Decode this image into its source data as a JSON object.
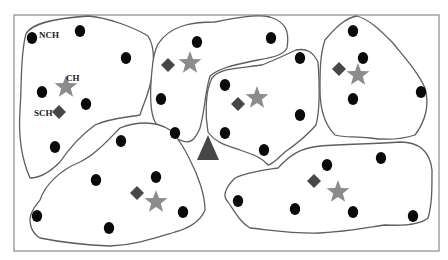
{
  "diagram": {
    "type": "wireless-sensor-network-clustering",
    "colors": {
      "normal_node": "#0a0a0a",
      "cluster_head": "#8c8c8c",
      "sub_cluster_head": "#474747",
      "base_station": "#474747",
      "cluster_border": "#5e5e5e",
      "frame": "#8a8a8a"
    },
    "labels": {
      "nch": "NCH",
      "ch": "CH",
      "sch": "SCH"
    },
    "base_station": {
      "shape": "triangle",
      "x": 208,
      "y": 148
    },
    "clusters": [
      {
        "id": "cluster-top-left",
        "ch": [
          66,
          87
        ],
        "sch": [
          59,
          112
        ],
        "nodes": [
          [
            32,
            38
          ],
          [
            80,
            31
          ],
          [
            126,
            58
          ],
          [
            42,
            92
          ],
          [
            86,
            104
          ],
          [
            55,
            147
          ]
        ]
      },
      {
        "id": "cluster-top-center",
        "ch": [
          190,
          63
        ],
        "sch": [
          168,
          65
        ],
        "nodes": [
          [
            197,
            42
          ],
          [
            271,
            38
          ],
          [
            161,
            99
          ],
          [
            175,
            133
          ]
        ]
      },
      {
        "id": "cluster-center",
        "ch": [
          257,
          98
        ],
        "sch": [
          238,
          104
        ],
        "nodes": [
          [
            225,
            85
          ],
          [
            300,
            58
          ],
          [
            300,
            115
          ],
          [
            225,
            133
          ],
          [
            264,
            150
          ]
        ]
      },
      {
        "id": "cluster-top-right",
        "ch": [
          358,
          75
        ],
        "sch": [
          339,
          69
        ],
        "nodes": [
          [
            353,
            31
          ],
          [
            363,
            58
          ],
          [
            353,
            99
          ],
          [
            421,
            92
          ]
        ]
      },
      {
        "id": "cluster-bottom-left",
        "ch": [
          156,
          202
        ],
        "sch": [
          137,
          193
        ],
        "nodes": [
          [
            121,
            141
          ],
          [
            96,
            180
          ],
          [
            156,
            177
          ],
          [
            37,
            216
          ],
          [
            183,
            212
          ],
          [
            109,
            228
          ]
        ]
      },
      {
        "id": "cluster-bottom-right",
        "ch": [
          338,
          192
        ],
        "sch": [
          314,
          181
        ],
        "nodes": [
          [
            327,
            165
          ],
          [
            381,
            158
          ],
          [
            238,
            201
          ],
          [
            295,
            209
          ],
          [
            353,
            212
          ],
          [
            413,
            216
          ]
        ]
      }
    ]
  }
}
